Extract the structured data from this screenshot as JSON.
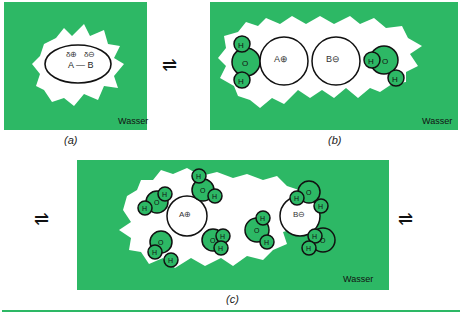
{
  "colors": {
    "water": "#2db865",
    "cavity": "#ffffff",
    "outline": "#111111"
  },
  "panels": {
    "a": {
      "caption": "(a)",
      "solvent_label": "Wasser",
      "charge_a": "δ⊕",
      "charge_b": "δ⊖",
      "molecule": "A — B"
    },
    "b": {
      "caption": "(b)",
      "solvent_label": "Wasser",
      "ion_a": "A⊕",
      "ion_b": "B⊖"
    },
    "c": {
      "caption": "(c)",
      "solvent_label": "Wasser",
      "ion_a": "A⊕",
      "ion_b": "B⊖"
    }
  },
  "atoms": {
    "h": "H",
    "o": "O"
  },
  "equilibrium_symbol": "⇌"
}
